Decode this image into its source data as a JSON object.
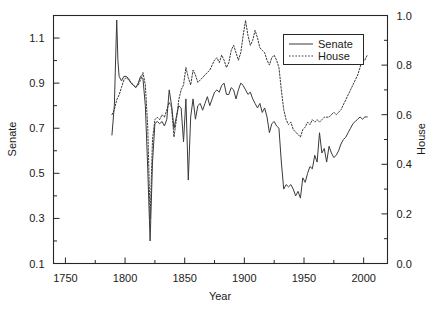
{
  "chart_data": {
    "type": "line",
    "title": "",
    "xlabel": "Year",
    "ylabel": "Senate",
    "y2label": "House",
    "xlim": [
      1740,
      2020
    ],
    "ylim": [
      0.1,
      1.2
    ],
    "y2lim": [
      0.0,
      1.0
    ],
    "grid": false,
    "legend_position": "top-right",
    "xticks": [
      1750,
      1800,
      1850,
      1900,
      1950,
      2000
    ],
    "xtick_labels": [
      "1750",
      "1800",
      "1850",
      "1900",
      "1950",
      "2000"
    ],
    "xminor_ticks": [
      1775,
      1825,
      1875,
      1925,
      1975
    ],
    "yticks": [
      0.1,
      0.3,
      0.5,
      0.7,
      0.9,
      1.1
    ],
    "ytick_labels": [
      "0.1",
      "0.3",
      "0.5",
      "0.7",
      "0.9",
      "1.1"
    ],
    "yminor_ticks": [
      0.2,
      0.4,
      0.6,
      0.8,
      1.0
    ],
    "y2ticks": [
      0.0,
      0.2,
      0.4,
      0.6,
      0.8,
      1.0
    ],
    "y2tick_labels": [
      "0.0",
      "0.2",
      "0.4",
      "0.6",
      "0.8",
      "1.0"
    ],
    "y2minor_ticks": [
      0.1,
      0.3,
      0.5,
      0.7,
      0.9
    ],
    "series": [
      {
        "name": "Senate",
        "axis": "left",
        "style": "solid",
        "color": "#3a3a3a",
        "x": [
          1789,
          1791,
          1793,
          1794,
          1795,
          1797,
          1799,
          1801,
          1803,
          1805,
          1807,
          1809,
          1811,
          1813,
          1815,
          1817,
          1819,
          1821,
          1823,
          1825,
          1827,
          1829,
          1831,
          1833,
          1835,
          1837,
          1839,
          1841,
          1843,
          1845,
          1847,
          1849,
          1851,
          1853,
          1855,
          1857,
          1859,
          1861,
          1863,
          1865,
          1867,
          1869,
          1871,
          1873,
          1875,
          1877,
          1879,
          1881,
          1883,
          1885,
          1887,
          1889,
          1891,
          1893,
          1895,
          1897,
          1899,
          1901,
          1903,
          1905,
          1907,
          1909,
          1911,
          1913,
          1915,
          1917,
          1919,
          1921,
          1923,
          1925,
          1927,
          1929,
          1931,
          1933,
          1935,
          1937,
          1939,
          1941,
          1943,
          1945,
          1947,
          1949,
          1951,
          1953,
          1955,
          1957,
          1959,
          1961,
          1963,
          1965,
          1967,
          1969,
          1971,
          1973,
          1975,
          1977,
          1979,
          1981,
          1983,
          1985,
          1987,
          1989,
          1991,
          1993,
          1995,
          1997,
          1999,
          2001,
          2003
        ],
        "y": [
          0.67,
          0.8,
          1.18,
          1.0,
          0.93,
          0.91,
          0.93,
          0.93,
          0.92,
          0.9,
          0.89,
          0.88,
          0.9,
          0.93,
          0.92,
          0.8,
          0.52,
          0.2,
          0.55,
          0.72,
          0.73,
          0.72,
          0.73,
          0.71,
          0.74,
          0.87,
          0.8,
          0.7,
          0.75,
          0.8,
          0.79,
          0.64,
          0.83,
          0.47,
          0.75,
          0.83,
          0.74,
          0.8,
          0.81,
          0.78,
          0.81,
          0.84,
          0.8,
          0.83,
          0.86,
          0.87,
          0.86,
          0.89,
          0.9,
          0.85,
          0.85,
          0.88,
          0.87,
          0.83,
          0.87,
          0.9,
          0.89,
          0.87,
          0.85,
          0.86,
          0.83,
          0.81,
          0.79,
          0.81,
          0.77,
          0.79,
          0.75,
          0.68,
          0.72,
          0.73,
          0.71,
          0.7,
          0.55,
          0.43,
          0.45,
          0.44,
          0.45,
          0.43,
          0.4,
          0.42,
          0.39,
          0.48,
          0.46,
          0.5,
          0.53,
          0.52,
          0.58,
          0.55,
          0.68,
          0.59,
          0.61,
          0.55,
          0.62,
          0.59,
          0.57,
          0.58,
          0.6,
          0.63,
          0.65,
          0.66,
          0.68,
          0.7,
          0.72,
          0.73,
          0.74,
          0.75,
          0.74,
          0.75,
          0.75
        ]
      },
      {
        "name": "House",
        "axis": "right",
        "style": "dotted",
        "color": "#3a3a3a",
        "x": [
          1789,
          1791,
          1793,
          1795,
          1797,
          1799,
          1801,
          1803,
          1805,
          1807,
          1809,
          1811,
          1813,
          1815,
          1817,
          1819,
          1821,
          1823,
          1825,
          1827,
          1829,
          1831,
          1833,
          1835,
          1837,
          1839,
          1841,
          1843,
          1845,
          1847,
          1849,
          1851,
          1853,
          1855,
          1857,
          1859,
          1861,
          1863,
          1865,
          1867,
          1869,
          1871,
          1873,
          1875,
          1877,
          1879,
          1881,
          1883,
          1885,
          1887,
          1889,
          1891,
          1893,
          1895,
          1897,
          1899,
          1901,
          1903,
          1905,
          1907,
          1909,
          1911,
          1913,
          1915,
          1917,
          1919,
          1921,
          1923,
          1925,
          1927,
          1929,
          1931,
          1933,
          1935,
          1937,
          1939,
          1941,
          1943,
          1945,
          1947,
          1949,
          1951,
          1953,
          1955,
          1957,
          1959,
          1961,
          1963,
          1965,
          1967,
          1969,
          1971,
          1973,
          1975,
          1977,
          1979,
          1981,
          1983,
          1985,
          1987,
          1989,
          1991,
          1993,
          1995,
          1997,
          1999,
          2001,
          2003
        ],
        "y": [
          0.6,
          0.62,
          0.66,
          0.68,
          0.71,
          0.74,
          0.75,
          0.74,
          0.73,
          0.72,
          0.71,
          0.72,
          0.74,
          0.77,
          0.72,
          0.55,
          0.18,
          0.5,
          0.58,
          0.59,
          0.58,
          0.6,
          0.59,
          0.62,
          0.65,
          0.63,
          0.51,
          0.58,
          0.66,
          0.7,
          0.72,
          0.79,
          0.75,
          0.72,
          0.78,
          0.76,
          0.73,
          0.74,
          0.75,
          0.76,
          0.77,
          0.78,
          0.8,
          0.82,
          0.83,
          0.81,
          0.84,
          0.82,
          0.79,
          0.81,
          0.86,
          0.88,
          0.85,
          0.82,
          0.85,
          0.92,
          0.98,
          0.92,
          0.88,
          0.9,
          0.94,
          0.91,
          0.87,
          0.86,
          0.85,
          0.82,
          0.8,
          0.83,
          0.84,
          0.82,
          0.79,
          0.7,
          0.62,
          0.58,
          0.56,
          0.57,
          0.54,
          0.53,
          0.52,
          0.51,
          0.54,
          0.55,
          0.57,
          0.56,
          0.58,
          0.57,
          0.58,
          0.57,
          0.58,
          0.59,
          0.59,
          0.59,
          0.6,
          0.61,
          0.6,
          0.61,
          0.62,
          0.64,
          0.66,
          0.68,
          0.7,
          0.72,
          0.74,
          0.76,
          0.79,
          0.83,
          0.82,
          0.84
        ]
      }
    ]
  },
  "legend": {
    "items": [
      {
        "label": "Senate",
        "style": "solid"
      },
      {
        "label": "House",
        "style": "dotted"
      }
    ]
  },
  "axes": {
    "x_title": "Year",
    "y_left_title": "Senate",
    "y_right_title": "House"
  }
}
